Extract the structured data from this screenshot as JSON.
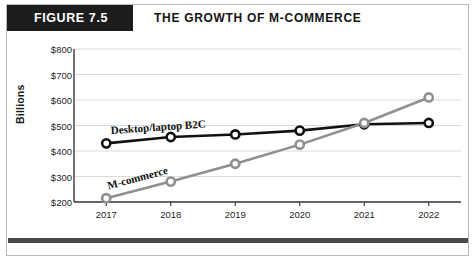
{
  "header": {
    "badge": "FIGURE 7.5",
    "title": "THE GROWTH OF M-COMMERCE"
  },
  "chart_data": {
    "type": "line",
    "title": "THE GROWTH OF M-COMMERCE",
    "xlabel": "",
    "ylabel": "Billions",
    "categories": [
      "2017",
      "2018",
      "2019",
      "2020",
      "2021",
      "2022"
    ],
    "ylim": [
      200,
      800
    ],
    "ytick_labels": [
      "$800",
      "$700",
      "$600",
      "$500",
      "$400",
      "$300",
      "$200"
    ],
    "ytick_values": [
      800,
      700,
      600,
      500,
      400,
      300,
      200
    ],
    "grid": true,
    "legend_position": "inline-annotation",
    "series": [
      {
        "name": "Desktop/laptop B2C",
        "color": "#111111",
        "values": [
          430,
          455,
          465,
          480,
          505,
          510
        ]
      },
      {
        "name": "M-commerce",
        "color": "#8f8f8f",
        "values": [
          215,
          280,
          350,
          425,
          510,
          610
        ]
      }
    ],
    "annotations": [
      {
        "text": "Desktop/laptop B2C",
        "series": "Desktop/laptop B2C"
      },
      {
        "text": "M-commerce",
        "series": "M-commerce"
      }
    ]
  }
}
